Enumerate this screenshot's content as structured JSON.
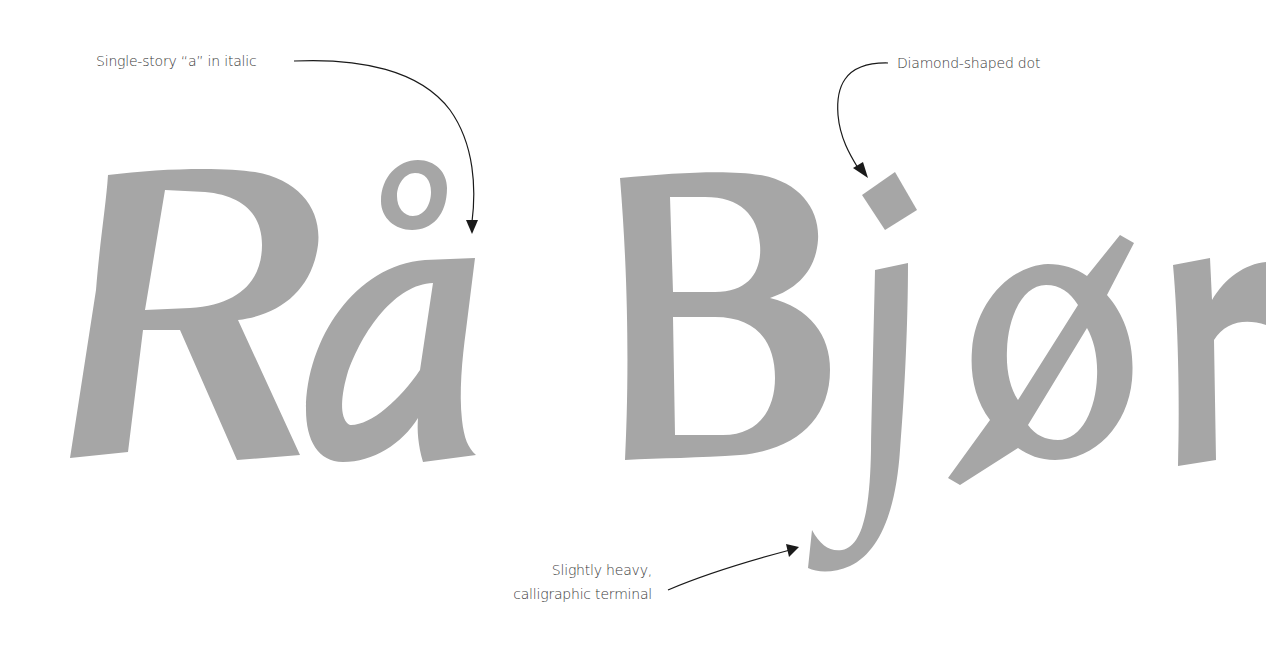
{
  "specimen": {
    "words": [
      "Rå",
      "Bjør"
    ],
    "glyph_color": "#a6a6a6",
    "annotation_color": "#1a1a1a"
  },
  "annotations": [
    {
      "id": "single-story-a",
      "text": "Single-story “a” in italic",
      "target": "a"
    },
    {
      "id": "diamond-dot",
      "text": "Diamond-shaped dot",
      "target": "j-dot"
    },
    {
      "id": "terminal",
      "lines": [
        "Slightly heavy,",
        "calligraphic terminal"
      ],
      "target": "j-terminal"
    }
  ]
}
